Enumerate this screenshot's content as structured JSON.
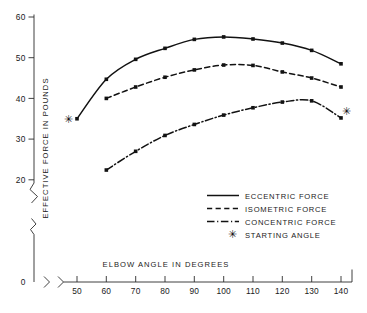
{
  "chart_data": {
    "type": "line",
    "title": "",
    "xlabel": "ELBOW ANGLE IN DEGREES",
    "ylabel": "EFFECTIVE FORCE IN POUNDS",
    "xlim": [
      50,
      140
    ],
    "ylim": [
      20,
      60
    ],
    "y_axis_break": true,
    "y_axis_zero_label": "0",
    "grid": false,
    "legend_position": "inside-lower-right",
    "xticks": [
      50,
      60,
      70,
      80,
      90,
      100,
      110,
      120,
      130,
      140
    ],
    "xtick_labels": [
      "50",
      "60",
      "70",
      "80",
      "90",
      "100",
      "110",
      "120",
      "130",
      "140"
    ],
    "yticks": [
      20,
      30,
      40,
      50,
      60
    ],
    "ytick_labels": [
      "20",
      "30",
      "40",
      "50",
      "60"
    ],
    "series": [
      {
        "name": "ECCENTRIC FORCE",
        "style": "solid",
        "x": [
          50,
          60,
          70,
          80,
          90,
          100,
          110,
          120,
          130,
          140
        ],
        "values": [
          35.0,
          44.7,
          49.6,
          52.3,
          54.5,
          55.1,
          54.6,
          53.6,
          51.8,
          48.5
        ]
      },
      {
        "name": "ISOMETRIC FORCE",
        "style": "dashed",
        "x": [
          60,
          70,
          80,
          90,
          100,
          110,
          120,
          130,
          140
        ],
        "values": [
          40.0,
          42.8,
          45.2,
          47.0,
          48.2,
          48.1,
          46.5,
          45.0,
          42.8
        ]
      },
      {
        "name": "CONCENTRIC FORCE",
        "style": "dashdot",
        "x": [
          60,
          70,
          80,
          90,
          100,
          110,
          120,
          130,
          140
        ],
        "values": [
          22.4,
          27.0,
          30.9,
          33.6,
          35.9,
          37.7,
          39.1,
          39.4,
          35.2
        ]
      }
    ],
    "annotations": [
      {
        "label": "STARTING ANGLE",
        "marker": "asterisk",
        "x": 47,
        "y": 35.0
      },
      {
        "label": "STARTING ANGLE",
        "marker": "asterisk",
        "x": 142,
        "y": 37.0
      }
    ]
  },
  "legend": {
    "entries": [
      {
        "label": "ECCENTRIC FORCE",
        "style": "solid"
      },
      {
        "label": "ISOMETRIC FORCE",
        "style": "dashed"
      },
      {
        "label": "CONCENTRIC FORCE",
        "style": "dashdot"
      },
      {
        "label": "STARTING ANGLE",
        "style": "asterisk"
      }
    ]
  },
  "axes": {
    "y_title": "EFFECTIVE FORCE IN POUNDS",
    "x_title": "ELBOW ANGLE IN DEGREES",
    "origin_label": "0",
    "ytick_60": "60",
    "ytick_50": "50",
    "ytick_40": "40",
    "ytick_30": "30",
    "ytick_20": "20",
    "xtick_50": "50",
    "xtick_60": "60",
    "xtick_70": "70",
    "xtick_80": "80",
    "xtick_90": "90",
    "xtick_100": "100",
    "xtick_110": "110",
    "xtick_120": "120",
    "xtick_130": "130",
    "xtick_140": "140"
  },
  "glyphs": {
    "asterisk": "✳"
  }
}
